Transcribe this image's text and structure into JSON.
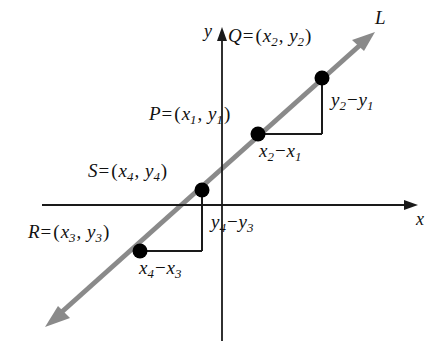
{
  "figure": {
    "name": "slope-similar-triangles-diagram",
    "line_label": "L",
    "axes": {
      "x_label": "x",
      "y_label": "y"
    },
    "points": [
      {
        "id": "Q",
        "label_text": "Q = (x2, y2)",
        "name": "Q",
        "eq": "=",
        "sub_x": "2",
        "sub_y": "2"
      },
      {
        "id": "P",
        "label_text": "P = (x1, y1)",
        "name": "P",
        "eq": "=",
        "sub_x": "1",
        "sub_y": "1"
      },
      {
        "id": "S",
        "label_text": "S = (x4, y4)",
        "name": "S",
        "eq": "=",
        "sub_x": "4",
        "sub_y": "4"
      },
      {
        "id": "R",
        "label_text": "R = (x3, y3)",
        "name": "R",
        "eq": "=",
        "sub_x": "3",
        "sub_y": "3"
      }
    ],
    "labels": {
      "point_q": {
        "var": "Q",
        "eq": "=",
        "open": "(",
        "x_var": "x",
        "x_sub": "2",
        "comma": ",",
        "y_var": "y",
        "y_sub": "2",
        "close": ")"
      },
      "point_p": {
        "var": "P",
        "eq": "=",
        "open": "(",
        "x_var": "x",
        "x_sub": "1",
        "comma": ",",
        "y_var": "y",
        "y_sub": "1",
        "close": ")"
      },
      "point_s": {
        "var": "S",
        "eq": "=",
        "open": "(",
        "x_var": "x",
        "x_sub": "4",
        "comma": ",",
        "y_var": "y",
        "y_sub": "4",
        "close": ")"
      },
      "point_r": {
        "var": "R",
        "eq": "=",
        "open": "(",
        "x_var": "x",
        "x_sub": "3",
        "comma": ",",
        "y_var": "y",
        "y_sub": "3",
        "close": ")"
      },
      "run_top": {
        "a_var": "x",
        "a_sub": "2",
        "op": "−",
        "b_var": "x",
        "b_sub": "1"
      },
      "rise_top": {
        "a_var": "y",
        "a_sub": "2",
        "op": "−",
        "b_var": "y",
        "b_sub": "1"
      },
      "run_bottom": {
        "a_var": "x",
        "a_sub": "4",
        "op": "−",
        "b_var": "x",
        "b_sub": "3"
      },
      "rise_bottom": {
        "a_var": "y",
        "a_sub": "4",
        "op": "−",
        "b_var": "y",
        "b_sub": "3"
      }
    },
    "colors": {
      "line": "#8a8a8a",
      "axis": "#1a1a1a",
      "leg": "#1a1a1a",
      "dot": "#000000",
      "background": "#ffffff"
    },
    "geometry": {
      "x_axis_y": 205,
      "y_axis_x": 222,
      "point_P": [
        258,
        134
      ],
      "point_Q": [
        322,
        78
      ],
      "point_R": [
        140,
        251
      ],
      "point_S": [
        202,
        190
      ]
    }
  }
}
